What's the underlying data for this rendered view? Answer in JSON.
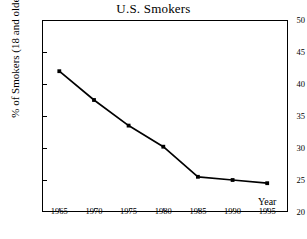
{
  "chart_data": {
    "type": "line",
    "title": "U.S. Smokers",
    "xlabel": "Year",
    "ylabel": "% of Smokers (18 and older)",
    "x": [
      1965,
      1970,
      1975,
      1980,
      1985,
      1990,
      1995
    ],
    "values": [
      42.0,
      37.5,
      33.5,
      30.2,
      25.5,
      25.0,
      24.5
    ],
    "series": [
      {
        "name": "% of Smokers (18 and older)",
        "values": [
          42.0,
          37.5,
          33.5,
          30.2,
          25.5,
          25.0,
          24.5
        ]
      }
    ],
    "xtick_labels": [
      "1965",
      "1970",
      "1975",
      "1980",
      "1985",
      "1990",
      "1995"
    ],
    "ytick_labels": [
      "20",
      "25",
      "30",
      "35",
      "40",
      "45",
      "50"
    ],
    "yticks": [
      20,
      25,
      30,
      35,
      40,
      45,
      50
    ],
    "xlim": [
      1962.5,
      1998.0
    ],
    "ylim": [
      20,
      50
    ],
    "grid": false,
    "legend": "none",
    "marker": "square",
    "line_color": "#000000",
    "marker_color": "#000000",
    "frame_color": "#000000",
    "background_color": "#ffffff"
  }
}
